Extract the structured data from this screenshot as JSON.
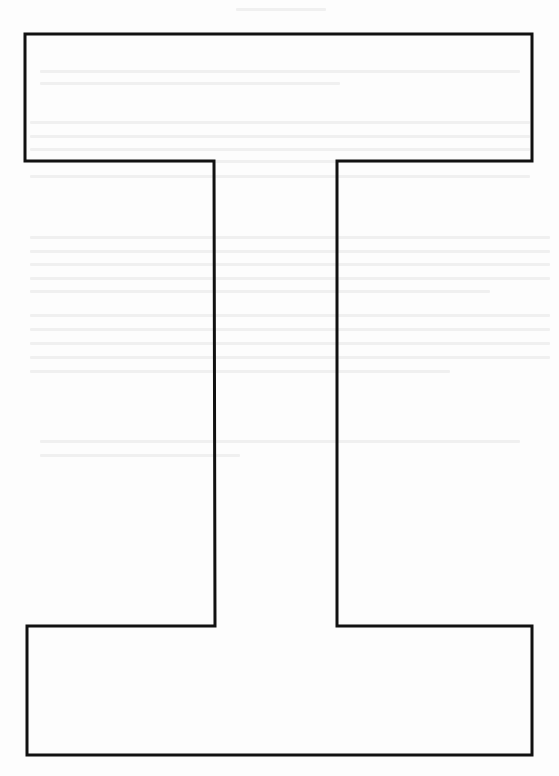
{
  "figure": {
    "type": "outline-shape",
    "shape_name": "capital-I / I-beam outline",
    "stroke_color": "#111111",
    "stroke_width": 3,
    "fill_color": "#ffffff",
    "background_color": "#fdfdfd",
    "bleed_through_color": "#e6e6e6",
    "points": [
      [
        25,
        34
      ],
      [
        532,
        34
      ],
      [
        532,
        161
      ],
      [
        337,
        161
      ],
      [
        337,
        626
      ],
      [
        532,
        626
      ],
      [
        532,
        755
      ],
      [
        27,
        755
      ],
      [
        27,
        626
      ],
      [
        215,
        626
      ],
      [
        214,
        161
      ],
      [
        25,
        161
      ]
    ],
    "regions": {
      "top_bar": {
        "x": 25,
        "y": 34,
        "width": 507,
        "height": 127
      },
      "stem": {
        "x": 214,
        "y": 161,
        "width": 123,
        "height": 465
      },
      "bottom_bar": {
        "x": 27,
        "y": 626,
        "width": 505,
        "height": 129
      }
    }
  },
  "bleed_through_lines": [
    {
      "x": 236,
      "y": 8,
      "w": 90
    },
    {
      "x": 40,
      "y": 70,
      "w": 480
    },
    {
      "x": 40,
      "y": 82,
      "w": 300
    },
    {
      "x": 30,
      "y": 121,
      "w": 500
    },
    {
      "x": 30,
      "y": 135,
      "w": 500
    },
    {
      "x": 30,
      "y": 148,
      "w": 500
    },
    {
      "x": 30,
      "y": 160,
      "w": 480
    },
    {
      "x": 30,
      "y": 175,
      "w": 500
    },
    {
      "x": 30,
      "y": 236,
      "w": 520
    },
    {
      "x": 30,
      "y": 250,
      "w": 520
    },
    {
      "x": 30,
      "y": 263,
      "w": 520
    },
    {
      "x": 30,
      "y": 277,
      "w": 520
    },
    {
      "x": 30,
      "y": 290,
      "w": 460
    },
    {
      "x": 30,
      "y": 314,
      "w": 520
    },
    {
      "x": 30,
      "y": 328,
      "w": 520
    },
    {
      "x": 30,
      "y": 342,
      "w": 520
    },
    {
      "x": 30,
      "y": 356,
      "w": 520
    },
    {
      "x": 30,
      "y": 370,
      "w": 420
    },
    {
      "x": 40,
      "y": 440,
      "w": 480
    },
    {
      "x": 40,
      "y": 454,
      "w": 200
    }
  ]
}
